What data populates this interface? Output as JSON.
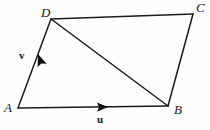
{
  "figure": {
    "type": "geometry-diagram",
    "shape": "parallelogram",
    "background_color": "#fefefe",
    "stroke_color": "#1a1a1a",
    "width": 210,
    "height": 130
  },
  "vertices": [
    {
      "id": "A",
      "label": "A",
      "x": 18,
      "y": 108,
      "label_x": 4,
      "label_y": 104
    },
    {
      "id": "B",
      "label": "B",
      "x": 168,
      "y": 106,
      "label_x": 175,
      "label_y": 106
    },
    {
      "id": "C",
      "label": "C",
      "x": 193,
      "y": 14,
      "label_x": 197,
      "label_y": 2
    },
    {
      "id": "D",
      "label": "D",
      "x": 51,
      "y": 19,
      "label_x": 41,
      "label_y": 7
    }
  ],
  "edges": [
    {
      "id": "AB",
      "from": "A",
      "to": "B",
      "kind": "vector",
      "vector_label": "u"
    },
    {
      "id": "AD",
      "from": "A",
      "to": "D",
      "kind": "vector",
      "vector_label": "v"
    },
    {
      "id": "DC",
      "from": "D",
      "to": "C",
      "kind": "side"
    },
    {
      "id": "CB",
      "from": "C",
      "to": "B",
      "kind": "side"
    },
    {
      "id": "DB",
      "from": "D",
      "to": "B",
      "kind": "diagonal"
    }
  ],
  "vector_labels": [
    {
      "id": "u",
      "text": "u",
      "x": 97,
      "y": 115,
      "edge": "AB"
    },
    {
      "id": "v",
      "text": "v",
      "x": 19,
      "y": 50,
      "edge": "AD"
    }
  ],
  "arrowheads": [
    {
      "id": "u-arrowhead",
      "on_edge": "AB",
      "x": 105,
      "y": 107,
      "angle_deg": -0.8
    },
    {
      "id": "v-arrowhead",
      "on_edge": "AD",
      "x": 36,
      "y": 58,
      "angle_deg": -110
    }
  ]
}
